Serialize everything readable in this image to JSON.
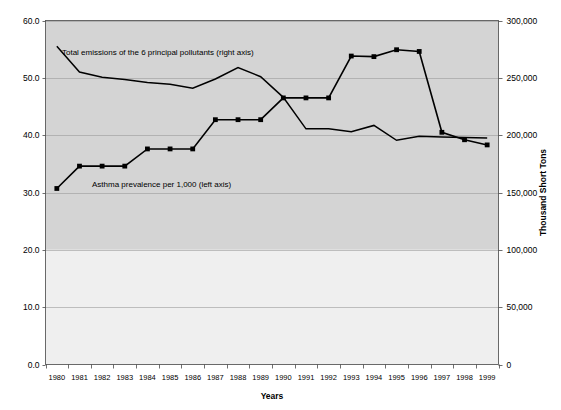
{
  "chart_data": {
    "type": "line",
    "title": "",
    "xlabel": "Years",
    "ylabel": "",
    "y2label": "Thousand Short Tons",
    "grid": true,
    "legend_position": "inline-annotation",
    "x": [
      1980,
      1981,
      1982,
      1983,
      1984,
      1985,
      1986,
      1987,
      1988,
      1989,
      1990,
      1991,
      1992,
      1993,
      1994,
      1995,
      1996,
      1997,
      1998,
      1999
    ],
    "xtick_labels": [
      "1980",
      "1981",
      "1982",
      "1983",
      "1984",
      "1985",
      "1986",
      "1987",
      "1988",
      "1989",
      "1990",
      "1991",
      "1992",
      "1993",
      "1994",
      "1995",
      "1996",
      "1997",
      "1998",
      "1999"
    ],
    "ylim": [
      0,
      60
    ],
    "ytick_labels": [
      "0.0",
      "10.0",
      "20.0",
      "30.0",
      "40.0",
      "50.0",
      "60.0"
    ],
    "ytick_values": [
      0,
      10,
      20,
      30,
      40,
      50,
      60
    ],
    "y2lim": [
      0,
      300000
    ],
    "y2tick_labels": [
      "0",
      "50,000",
      "100,000",
      "150,000",
      "200,000",
      "250,000",
      "300,000"
    ],
    "y2tick_values": [
      0,
      50000,
      100000,
      150000,
      200000,
      250000,
      300000
    ],
    "series": [
      {
        "name": "Asthma prevalence per 1,000 (left axis)",
        "axis": "left",
        "markers": "square",
        "color": "#000000",
        "values": [
          30.7,
          34.6,
          34.6,
          34.6,
          37.6,
          37.6,
          37.6,
          42.7,
          42.7,
          42.7,
          46.5,
          46.5,
          46.5,
          53.8,
          53.7,
          54.9,
          54.6,
          40.5,
          39.2,
          38.3
        ]
      },
      {
        "name": "Total emissions of the 6 principal pollutants (right axis)",
        "axis": "right",
        "markers": "none",
        "color": "#000000",
        "values": [
          277500,
          255000,
          250500,
          248500,
          246000,
          244500,
          241000,
          249000,
          259000,
          251000,
          233000,
          205500,
          205500,
          203000,
          208500,
          195500,
          199000,
          198500,
          198000,
          197500
        ]
      }
    ],
    "annotations": [
      {
        "text": "Total emissions of the 6 principal pollutants (right axis)",
        "series": "emissions"
      },
      {
        "text": "Asthma prevalence per 1,000 (left axis)",
        "series": "asthma"
      }
    ]
  },
  "axis": {
    "x_title": "Years",
    "y2_title": "Thousand Short Tons"
  }
}
